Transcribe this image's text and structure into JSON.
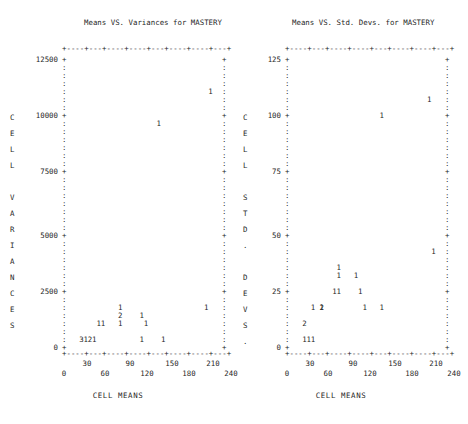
{
  "figure": {
    "kind": "character-mode-scatter-plot-pair",
    "shared_xlabel": "CELL MEANS"
  },
  "panels": [
    {
      "id": "variances",
      "title": "Means VS. Variances for MASTERY",
      "ylabel": "CELL VARIANCES",
      "ytick_labels": [
        "12500",
        "10000",
        "7500",
        "5000",
        "2500",
        "0"
      ],
      "xtick_labels_upper": [
        "30",
        "90",
        "150",
        "210"
      ],
      "xtick_labels_lower": [
        "0",
        "60",
        "120",
        "180",
        "240"
      ],
      "xlabel": "CELL MEANS",
      "axis_char_tick": "+",
      "axis_char_fill": ":",
      "axis_char_dash": "-"
    },
    {
      "id": "stddevs",
      "title": "Means VS. Std. Devs. for MASTERY",
      "ylabel": "CELL STD. DEVS.",
      "ytick_labels": [
        "125",
        "100",
        "75",
        "50",
        "25",
        "0"
      ],
      "xtick_labels_upper": [
        "30",
        "90",
        "150",
        "210"
      ],
      "xtick_labels_lower": [
        "0",
        "60",
        "120",
        "180",
        "240"
      ],
      "xlabel": "CELL MEANS",
      "axis_char_tick": "+",
      "axis_char_fill": ":",
      "axis_char_dash": "-"
    }
  ],
  "chart_data": [
    {
      "type": "scatter",
      "panel": "variances",
      "title": "Means VS. Variances for MASTERY",
      "xlabel": "CELL MEANS",
      "ylabel": "CELL VARIANCES",
      "xlim": [
        0,
        250
      ],
      "ylim": [
        0,
        12500
      ],
      "xticks": [
        0,
        30,
        60,
        90,
        120,
        150,
        180,
        210,
        240
      ],
      "yticks": [
        0,
        2500,
        5000,
        7500,
        10000,
        12500
      ],
      "grid": false,
      "legend": false,
      "marker_encoding": "digit glyph = number of coincident observations",
      "points": [
        {
          "x": 228,
          "y": 11200,
          "label": "1",
          "count": 1
        },
        {
          "x": 148,
          "y": 9800,
          "label": "1",
          "count": 1
        },
        {
          "x": 90,
          "y": 1750,
          "label": "1",
          "count": 1
        },
        {
          "x": 222,
          "y": 1750,
          "label": "1",
          "count": 1
        },
        {
          "x": 90,
          "y": 1400,
          "label": "2",
          "count": 2
        },
        {
          "x": 118,
          "y": 1400,
          "label": "1",
          "count": 1
        },
        {
          "x": 57,
          "y": 1050,
          "label": "1",
          "count": 1
        },
        {
          "x": 62,
          "y": 1050,
          "label": "1",
          "count": 1
        },
        {
          "x": 85,
          "y": 1050,
          "label": "1",
          "count": 1
        },
        {
          "x": 130,
          "y": 1050,
          "label": "1",
          "count": 1
        },
        {
          "x": 28,
          "y": 350,
          "label": "3",
          "count": 3
        },
        {
          "x": 33,
          "y": 350,
          "label": "1",
          "count": 1
        },
        {
          "x": 38,
          "y": 350,
          "label": "2",
          "count": 2
        },
        {
          "x": 50,
          "y": 350,
          "label": "1",
          "count": 1
        },
        {
          "x": 118,
          "y": 350,
          "label": "1",
          "count": 1
        },
        {
          "x": 152,
          "y": 350,
          "label": "1",
          "count": 1
        }
      ]
    },
    {
      "type": "scatter",
      "panel": "stddevs",
      "title": "Means VS. Std. Devs. for MASTERY",
      "xlabel": "CELL MEANS",
      "ylabel": "CELL STD. DEVS.",
      "xlim": [
        0,
        250
      ],
      "ylim": [
        0,
        125
      ],
      "xticks": [
        0,
        30,
        60,
        90,
        120,
        150,
        180,
        210,
        240
      ],
      "yticks": [
        0,
        25,
        50,
        75,
        100,
        125
      ],
      "grid": false,
      "legend": false,
      "marker_encoding": "digit glyph = number of coincident observations",
      "points": [
        {
          "x": 222,
          "y": 107,
          "label": "1",
          "count": 1
        },
        {
          "x": 150,
          "y": 100,
          "label": "1",
          "count": 1
        },
        {
          "x": 228,
          "y": 42,
          "label": "1",
          "count": 1
        },
        {
          "x": 78,
          "y": 35,
          "label": "1",
          "count": 1
        },
        {
          "x": 78,
          "y": 31,
          "label": "1",
          "count": 1
        },
        {
          "x": 108,
          "y": 31,
          "label": "1",
          "count": 1
        },
        {
          "x": 74,
          "y": 25,
          "label": "1",
          "count": 1
        },
        {
          "x": 79,
          "y": 25,
          "label": "1",
          "count": 1
        },
        {
          "x": 113,
          "y": 25,
          "label": "1",
          "count": 1
        },
        {
          "x": 38,
          "y": 17,
          "label": "1",
          "count": 1
        },
        {
          "x": 52,
          "y": 17,
          "label": "2",
          "count": 2
        },
        {
          "x": 57,
          "y": 17,
          "label": "1",
          "count": 1
        },
        {
          "x": 118,
          "y": 17,
          "label": "1",
          "count": 1
        },
        {
          "x": 148,
          "y": 17,
          "label": "1",
          "count": 1
        },
        {
          "x": 28,
          "y": 10,
          "label": "2",
          "count": 2
        },
        {
          "x": 28,
          "y": 5,
          "label": "1",
          "count": 1
        },
        {
          "x": 33,
          "y": 5,
          "label": "1",
          "count": 1
        },
        {
          "x": 38,
          "y": 5,
          "label": "1",
          "count": 1
        }
      ]
    }
  ]
}
